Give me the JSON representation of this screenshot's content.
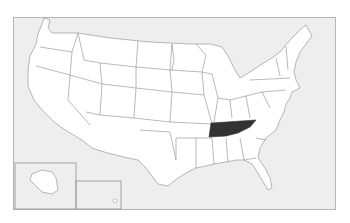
{
  "map": {
    "type": "US states locator map",
    "highlighted_state": "Tennessee",
    "colors": {
      "background": "#ffffff",
      "water": "#eeeeee",
      "land": "#ffffff",
      "borders": "#8a8a8a",
      "highlight": "#333333",
      "frame": "#b5b5b5"
    },
    "insets": [
      "Alaska",
      "Hawaii"
    ]
  }
}
